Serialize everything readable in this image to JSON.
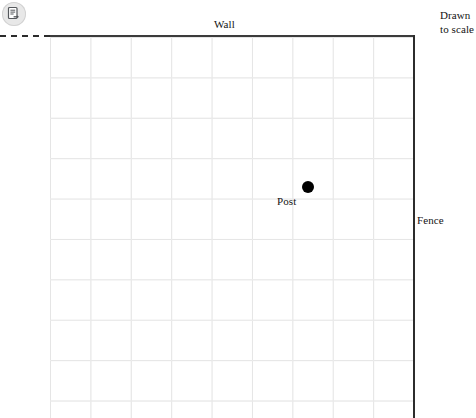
{
  "toolbar": {
    "share_icon": "document-export-icon"
  },
  "diagram": {
    "title_labels": {
      "wall": "Wall",
      "fence": "Fence",
      "post": "Post",
      "drawn_to_scale": "Drawn to scale"
    },
    "grid": {
      "columns": 9,
      "rows": 10,
      "cell_size_px": 40,
      "line_color": "#dcdcdc"
    },
    "features": [
      {
        "name": "wall",
        "type": "solid-boundary",
        "orientation": "horizontal",
        "position": "top",
        "color": "#3b3b3b"
      },
      {
        "name": "wall-dashed-extension",
        "type": "dashed-line",
        "orientation": "horizontal",
        "position": "top-left",
        "color": "#2b2b2b"
      },
      {
        "name": "fence",
        "type": "solid-boundary",
        "orientation": "vertical",
        "position": "right",
        "color": "#2c2c2c"
      },
      {
        "name": "post",
        "type": "point-marker",
        "grid_x": 6.25,
        "grid_y": 3.75,
        "color": "#000000"
      }
    ]
  }
}
